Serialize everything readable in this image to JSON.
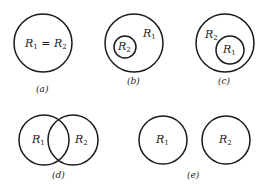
{
  "colors": {
    "stroke": "#1a1a1a",
    "background": "#ffffff"
  },
  "panels": [
    {
      "id": "a",
      "caption": "(a)",
      "label": {
        "r1": "R",
        "r1_sub": "1",
        "eq": " = ",
        "r2": "R",
        "r2_sub": "2"
      }
    },
    {
      "id": "b",
      "caption": "(b)",
      "outer_label": {
        "text": "R",
        "sub": "1"
      },
      "inner_label": {
        "text": "R",
        "sub": "2"
      }
    },
    {
      "id": "c",
      "caption": "(c)",
      "outer_label": {
        "text": "R",
        "sub": "2"
      },
      "inner_label": {
        "text": "R",
        "sub": "1"
      }
    },
    {
      "id": "d",
      "caption": "(d)",
      "left_label": {
        "text": "R",
        "sub": "1"
      },
      "right_label": {
        "text": "R",
        "sub": "2"
      }
    },
    {
      "id": "e",
      "caption": "(e)",
      "left_label": {
        "text": "R",
        "sub": "1"
      },
      "right_label": {
        "text": "R",
        "sub": "2"
      }
    }
  ]
}
